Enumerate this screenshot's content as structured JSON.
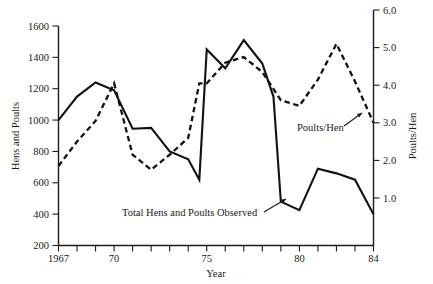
{
  "chart_data": {
    "type": "line",
    "title": "",
    "xlabel": "Year",
    "ylabel": "Hens and Poults",
    "y2label": "Poults/Hen",
    "x": [
      1967,
      1968,
      1969,
      1970,
      1971,
      1972,
      1973,
      1974,
      1975,
      1976,
      1977,
      1978,
      1979,
      1980,
      1981,
      1982,
      1983,
      1984
    ],
    "xtick_labels": [
      "1967",
      "70",
      "75",
      "80",
      "84"
    ],
    "xtick_values": [
      1967,
      1970,
      1975,
      1980,
      1984
    ],
    "xlim": [
      1967,
      1984
    ],
    "ylim": [
      200,
      1600
    ],
    "ytick_values": [
      200,
      400,
      600,
      800,
      1000,
      1200,
      1400,
      1600
    ],
    "ytick_labels": [
      "200",
      "400",
      "600",
      "800",
      "1000",
      "1200",
      "1400",
      "1600"
    ],
    "y2lim": [
      1.0,
      6.0
    ],
    "y2tick_values": [
      1.0,
      2.0,
      3.0,
      4.0,
      5.0,
      6.0
    ],
    "y2tick_labels": [
      "1.0",
      "2.0",
      "3.0",
      "4.0",
      "5.0",
      "6.0"
    ],
    "grid": false,
    "legend": "annotations",
    "series": [
      {
        "name": "Total Hens and Poults Observed",
        "axis": "left",
        "style": "solid",
        "x": [
          1967,
          1968,
          1969,
          1970,
          1971,
          1972,
          1973,
          1974,
          1974.6,
          1975,
          1976,
          1977,
          1978,
          1978.6,
          1979,
          1980,
          1981,
          1982,
          1983,
          1984
        ],
        "values": [
          1000,
          1150,
          1240,
          1190,
          945,
          950,
          800,
          750,
          620,
          1450,
          1330,
          1510,
          1360,
          1150,
          480,
          425,
          690,
          660,
          620,
          400
        ]
      },
      {
        "name": "Poults/Hen",
        "axis": "right",
        "style": "dashed",
        "x": [
          1967,
          1968,
          1969,
          1970,
          1971,
          1972,
          1973,
          1974,
          1974.6,
          1975,
          1976,
          1977,
          1978,
          1979,
          1980,
          1981,
          1982,
          1983,
          1984
        ],
        "values": [
          1.85,
          2.5,
          3.05,
          4.05,
          2.15,
          1.75,
          2.15,
          2.6,
          4.05,
          4.05,
          4.6,
          4.75,
          4.35,
          3.6,
          3.45,
          4.15,
          5.1,
          4.1,
          3.0
        ]
      }
    ],
    "annotations": [
      {
        "name": "poults-per-hen-label",
        "text": "Poults/Hen",
        "x": 297,
        "y": 131,
        "leader": {
          "x1": 344,
          "y1": 126,
          "x2": 362,
          "y2": 113
        }
      },
      {
        "name": "total-hens-label",
        "text": "Total Hens and Poults Observed",
        "x": 122,
        "y": 216,
        "leader": {
          "x1": 264,
          "y1": 212,
          "x2": 286,
          "y2": 199
        }
      }
    ]
  },
  "axes": {
    "left_title": "Hens and Poults",
    "right_title": "Poults/Hen",
    "bottom_title": "Year"
  }
}
